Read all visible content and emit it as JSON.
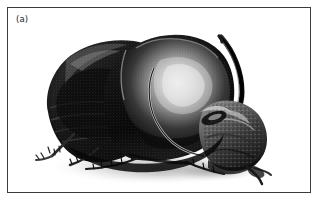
{
  "figure": {
    "panel_label": "(a)",
    "border_color": "#3b3b3b",
    "background_color": "#ffffff",
    "caption_area": ""
  },
  "photo": {
    "subject": "horned-dung-beetle",
    "description": "Black and white photograph of a horned beetle viewed from the front-left, body facing right, with a long curved cephalic horn sweeping upward and to the right",
    "rendering": "grayscale halftone photograph",
    "orientation": "head to the right, abdomen to the left",
    "tones": {
      "body_black": "#0b0b0b",
      "body_dark": "#1b1b1b",
      "body_mid": "#4a4a4a",
      "body_light": "#8e8e8e",
      "highlight": "#e6e6e6",
      "specular": "#f4f4f4",
      "shadow": "#b9b9b9",
      "background": "#ffffff"
    },
    "parts": [
      {
        "name": "elytra",
        "label": "wing covers"
      },
      {
        "name": "pronotum",
        "label": "thorax shield"
      },
      {
        "name": "horn",
        "label": "cephalic horn"
      },
      {
        "name": "head",
        "label": "head and clypeus"
      },
      {
        "name": "legs",
        "label": "spined legs"
      },
      {
        "name": "cast-shadow",
        "label": "ground shadow"
      }
    ]
  }
}
